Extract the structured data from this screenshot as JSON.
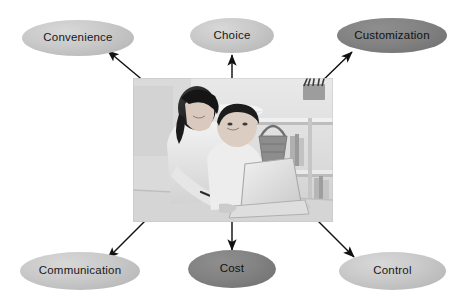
{
  "diagram": {
    "type": "radial-concept-map",
    "center": {
      "name": "center-photo",
      "description": "Black and white photograph of a woman leaning over a seated man who is using a laptop in a living room",
      "alt": "Couple using a laptop computer at home"
    },
    "nodes": [
      {
        "id": "convenience",
        "label": "Convenience",
        "tone": "light",
        "position": "top-left"
      },
      {
        "id": "choice",
        "label": "Choice",
        "tone": "light",
        "position": "top-center"
      },
      {
        "id": "customization",
        "label": "Customization",
        "tone": "dark",
        "position": "top-right"
      },
      {
        "id": "communication",
        "label": "Communication",
        "tone": "light",
        "position": "bottom-left"
      },
      {
        "id": "cost",
        "label": "Cost",
        "tone": "dark",
        "position": "bottom-center"
      },
      {
        "id": "control",
        "label": "Control",
        "tone": "light",
        "position": "bottom-right"
      }
    ],
    "connectors": [
      {
        "id": "arrow-to-convenience",
        "from": "center-photo",
        "to": "convenience",
        "direction": "up-left"
      },
      {
        "id": "arrow-to-choice",
        "from": "center-photo",
        "to": "choice",
        "direction": "up"
      },
      {
        "id": "arrow-to-customization",
        "from": "center-photo",
        "to": "customization",
        "direction": "up-right"
      },
      {
        "id": "arrow-to-communication",
        "from": "center-photo",
        "to": "communication",
        "direction": "down-left"
      },
      {
        "id": "arrow-to-cost",
        "from": "center-photo",
        "to": "cost",
        "direction": "down"
      },
      {
        "id": "arrow-to-control",
        "from": "center-photo",
        "to": "control",
        "direction": "down-right"
      }
    ],
    "colors": {
      "background": "#ffffff",
      "node_light": "#c9c9c9",
      "node_dark": "#7d7d7d",
      "text": "#18181a",
      "arrow": "#111111"
    }
  }
}
